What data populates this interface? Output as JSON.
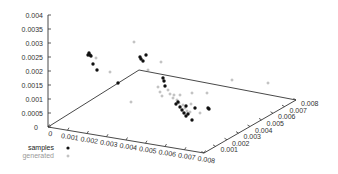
{
  "chart_data": {
    "type": "scatter3d",
    "title": "",
    "xlabel": "",
    "ylabel": "",
    "zlabel": "",
    "x_axis": {
      "range": [
        0,
        0.008
      ],
      "ticks": [
        "0",
        "0.001",
        "0.002",
        "0.003",
        "0.004",
        "0.005",
        "0.006",
        "0.007",
        "0.008"
      ]
    },
    "y_axis": {
      "range": [
        0,
        0.008
      ],
      "ticks": [
        "0",
        "0.001",
        "0.002",
        "0.003",
        "0.004",
        "0.005",
        "0.006",
        "0.007",
        "0.008"
      ]
    },
    "z_axis": {
      "range": [
        0,
        0.004
      ],
      "ticks": [
        "0",
        "0.0005",
        "0.001",
        "0.0015",
        "0.002",
        "0.0025",
        "0.003",
        "0.0035",
        "0.004"
      ]
    },
    "grid": false,
    "legend_position": "bottom-left",
    "legend": [
      {
        "name": "samples",
        "marker": "filled-circle",
        "color": "#111111"
      },
      {
        "name": "generated",
        "marker": "plus",
        "color": "#999999"
      }
    ],
    "series": [
      {
        "name": "samples",
        "points_screen": [
          [
            89,
            53
          ],
          [
            90,
            55
          ],
          [
            91,
            56
          ],
          [
            88,
            55
          ],
          [
            93,
            64
          ],
          [
            97,
            70
          ],
          [
            140,
            57
          ],
          [
            141,
            59
          ],
          [
            143,
            61
          ],
          [
            146,
            55
          ],
          [
            118,
            83
          ],
          [
            163,
            78
          ],
          [
            164,
            81
          ],
          [
            176,
            104
          ],
          [
            178,
            102
          ],
          [
            180,
            107
          ],
          [
            182,
            110
          ],
          [
            184,
            113
          ],
          [
            186,
            116
          ],
          [
            188,
            114
          ],
          [
            186,
            106
          ],
          [
            195,
            108
          ],
          [
            192,
            120
          ],
          [
            208,
            108
          ],
          [
            209,
            109
          ],
          [
            165,
            86
          ]
        ]
      },
      {
        "name": "generated",
        "points_screen": [
          [
            134,
            42
          ],
          [
            110,
            72
          ],
          [
            148,
            70
          ],
          [
            131,
            102
          ],
          [
            158,
            87
          ],
          [
            160,
            92
          ],
          [
            162,
            96
          ],
          [
            173,
            98
          ],
          [
            177,
            100
          ],
          [
            179,
            103
          ],
          [
            183,
            105
          ],
          [
            185,
            108
          ],
          [
            187,
            111
          ],
          [
            190,
            112
          ],
          [
            170,
            94
          ],
          [
            174,
            95
          ],
          [
            200,
            113
          ],
          [
            191,
            104
          ],
          [
            192,
            93
          ],
          [
            232,
            80
          ],
          [
            268,
            83
          ],
          [
            161,
            62
          ],
          [
            96,
            58
          ],
          [
            207,
            93
          ],
          [
            168,
            90
          ],
          [
            180,
            95
          ]
        ]
      }
    ]
  },
  "legend": {
    "samples_label": "samples",
    "generated_label": "generated"
  }
}
